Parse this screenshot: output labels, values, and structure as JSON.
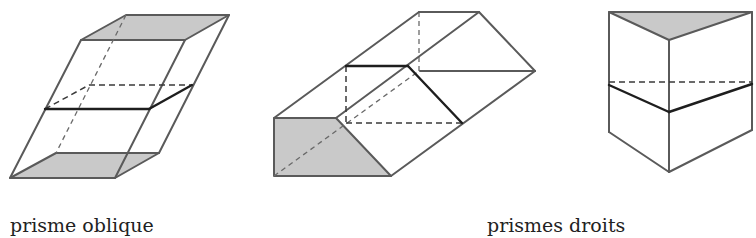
{
  "captions": {
    "oblique": "prisme oblique",
    "right": "prismes droits"
  },
  "figures": [
    {
      "id": "oblique-prism",
      "kind": "oblique prism with horizontal cross-section"
    },
    {
      "id": "right-prism-lying",
      "kind": "right prism lying on side, trapezoidal base, with cross-section"
    },
    {
      "id": "right-prism-triangular",
      "kind": "right triangular prism with cross-section"
    }
  ],
  "colors": {
    "edge": "#5a5a5a",
    "shade": "#c9c9c9",
    "section": "#1e1e1e"
  }
}
